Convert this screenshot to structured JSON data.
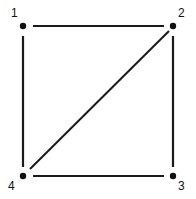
{
  "figure": {
    "background_color": "#ffffff",
    "stroke_color": "#1a1a1a",
    "width": 196,
    "height": 199
  },
  "graph": {
    "type": "undirected-graph",
    "vertex_count": 4,
    "edge_count": 5,
    "vertices": [
      {
        "id": "v1",
        "label": "1",
        "x": 23,
        "y": 26,
        "label_x": 11,
        "label_y": 7,
        "label_position": "above-left"
      },
      {
        "id": "v2",
        "label": "2",
        "x": 173,
        "y": 26,
        "label_x": 178,
        "label_y": 7,
        "label_position": "above-right"
      },
      {
        "id": "v3",
        "label": "3",
        "x": 173,
        "y": 176,
        "label_x": 178,
        "label_y": 180,
        "label_position": "below-right"
      },
      {
        "id": "v4",
        "label": "4",
        "x": 23,
        "y": 176,
        "label_x": 8,
        "label_y": 180,
        "label_position": "below-left"
      }
    ],
    "edges": [
      {
        "id": "e12",
        "from": "v1",
        "to": "v2",
        "name": "top-edge",
        "x1": 33,
        "y1": 26,
        "x2": 164,
        "y2": 26
      },
      {
        "id": "e14",
        "from": "v1",
        "to": "v4",
        "name": "left-edge",
        "x1": 23,
        "y1": 36,
        "x2": 23,
        "y2": 167
      },
      {
        "id": "e23",
        "from": "v2",
        "to": "v3",
        "name": "right-edge",
        "x1": 173,
        "y1": 36,
        "x2": 173,
        "y2": 167
      },
      {
        "id": "e43",
        "from": "v4",
        "to": "v3",
        "name": "bottom-edge",
        "x1": 33,
        "y1": 176,
        "x2": 164,
        "y2": 176
      },
      {
        "id": "e42",
        "from": "v4",
        "to": "v2",
        "name": "diagonal-edge",
        "x1": 30,
        "y1": 169,
        "x2": 169,
        "y2": 31
      }
    ],
    "vertex_dot_radius": 3.2,
    "edge_stroke_width": 2.2
  }
}
